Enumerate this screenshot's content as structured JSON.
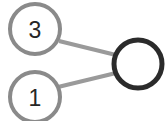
{
  "graph": {
    "background_color": "#ffffff",
    "edge_color": "#9a9a9a",
    "edge_width": 4,
    "nodes": [
      {
        "id": "node-3",
        "label": "3",
        "cx": 35,
        "cy": 29,
        "r": 25,
        "stroke_color": "#8a8a8a",
        "stroke_width": 4,
        "fill_color": "#ffffff",
        "label_color": "#262626",
        "label_size": 23
      },
      {
        "id": "node-1",
        "label": "1",
        "cx": 35,
        "cy": 97,
        "r": 25,
        "stroke_color": "#8a8a8a",
        "stroke_width": 4,
        "fill_color": "#ffffff",
        "label_color": "#262626",
        "label_size": 23
      },
      {
        "id": "node-empty",
        "label": "",
        "cx": 138,
        "cy": 64,
        "r": 24,
        "stroke_color": "#2b2b2b",
        "stroke_width": 5,
        "fill_color": "#ffffff",
        "label_color": "#262626",
        "label_size": 23
      }
    ],
    "edges": [
      {
        "id": "edge-3-to-empty",
        "from": "node-3",
        "to": "node-empty",
        "x1": 59,
        "y1": 41,
        "x2": 116,
        "y2": 55,
        "color": "#9a9a9a",
        "width": 4
      },
      {
        "id": "edge-1-to-empty",
        "from": "node-1",
        "to": "node-empty",
        "x1": 58,
        "y1": 87,
        "x2": 116,
        "y2": 73,
        "color": "#9a9a9a",
        "width": 4
      }
    ]
  }
}
